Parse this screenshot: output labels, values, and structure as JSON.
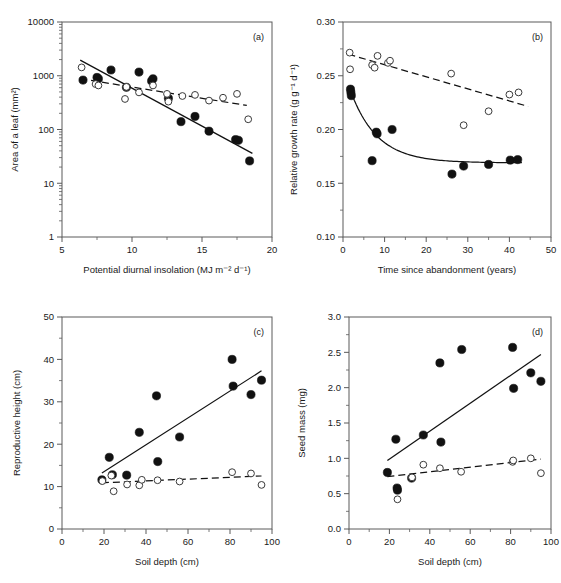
{
  "figure": {
    "title": "",
    "panels": [
      "a",
      "b",
      "c",
      "d"
    ]
  },
  "chart_data": [
    {
      "id": "a",
      "panel_label": "(a)",
      "type": "scatter",
      "title": "",
      "xlabel": "Potential diurnal insolation (MJ m⁻² d⁻¹)",
      "ylabel": "Area of a leaf (mm²)",
      "xscale": "linear",
      "yscale": "log",
      "xlim": [
        5,
        20
      ],
      "ylim": [
        1,
        10000
      ],
      "xticks": [
        5,
        10,
        15,
        20
      ],
      "xticklabels": [
        "5",
        "10",
        "15",
        "20"
      ],
      "yticks": [
        1,
        10,
        100,
        1000,
        10000
      ],
      "yticklabels": [
        "1",
        "10",
        "100",
        "1000",
        "10000"
      ],
      "grid": false,
      "legend": "none",
      "series": [
        {
          "name": "filled",
          "marker": "filled-circle",
          "points": [
            [
              6.5,
              830
            ],
            [
              7.5,
              930
            ],
            [
              7.6,
              880
            ],
            [
              8.5,
              1280
            ],
            [
              9.6,
              610
            ],
            [
              10.5,
              1170
            ],
            [
              11.4,
              800
            ],
            [
              11.5,
              880
            ],
            [
              12.6,
              380
            ],
            [
              13.5,
              140
            ],
            [
              14.5,
              175
            ],
            [
              15.5,
              93
            ],
            [
              17.4,
              65
            ],
            [
              17.6,
              63
            ],
            [
              18.4,
              26
            ]
          ],
          "fit": {
            "style": "solid",
            "x": [
              6.3,
              18.6
            ],
            "y": [
              1950,
              36
            ]
          }
        },
        {
          "name": "open",
          "marker": "open-circle",
          "points": [
            [
              6.4,
              1430
            ],
            [
              7.4,
              700
            ],
            [
              7.6,
              660
            ],
            [
              9.5,
              370
            ],
            [
              9.6,
              620
            ],
            [
              10.5,
              490
            ],
            [
              11.5,
              660
            ],
            [
              12.5,
              460
            ],
            [
              12.6,
              330
            ],
            [
              13.6,
              420
            ],
            [
              14.5,
              440
            ],
            [
              15.5,
              345
            ],
            [
              16.5,
              390
            ],
            [
              17.5,
              460
            ],
            [
              18.3,
              155
            ]
          ],
          "fit": {
            "style": "dashed",
            "x": [
              6.3,
              18.2
            ],
            "y": [
              880,
              280
            ]
          }
        }
      ]
    },
    {
      "id": "b",
      "panel_label": "(b)",
      "type": "scatter",
      "title": "",
      "xlabel": "Time since abandonment (years)",
      "ylabel": "Relative growth rate (g g⁻¹ d⁻¹)",
      "xscale": "linear",
      "yscale": "linear",
      "xlim": [
        0,
        50
      ],
      "ylim": [
        0.1,
        0.3
      ],
      "xticks": [
        0,
        10,
        20,
        30,
        40,
        50
      ],
      "xticklabels": [
        "0",
        "10",
        "20",
        "30",
        "40",
        "50"
      ],
      "yticks": [
        0.1,
        0.15,
        0.2,
        0.25,
        0.3
      ],
      "yticklabels": [
        "0.10",
        "0.15",
        "0.20",
        "0.25",
        "0.30"
      ],
      "grid": false,
      "legend": "none",
      "series": [
        {
          "name": "filled",
          "marker": "filled-circle",
          "points": [
            [
              1.8,
              0.2375
            ],
            [
              1.9,
              0.2345
            ],
            [
              2.0,
              0.2315
            ],
            [
              7.0,
              0.171
            ],
            [
              8.0,
              0.1975
            ],
            [
              8.2,
              0.196
            ],
            [
              11.8,
              0.2
            ],
            [
              26.2,
              0.1585
            ],
            [
              29.0,
              0.166
            ],
            [
              35.0,
              0.1675
            ],
            [
              40.2,
              0.1715
            ],
            [
              42.0,
              0.172
            ]
          ],
          "fit": {
            "style": "solid-curve",
            "model": "exponential-decay",
            "x_start": 1.8,
            "x_end": 43.0,
            "y_start": 0.236,
            "y_asymptote": 0.169,
            "rate": 0.155
          }
        },
        {
          "name": "open",
          "marker": "open-circle",
          "points": [
            [
              1.6,
              0.2715
            ],
            [
              1.7,
              0.256
            ],
            [
              7.0,
              0.26
            ],
            [
              7.6,
              0.2575
            ],
            [
              8.3,
              0.2685
            ],
            [
              10.8,
              0.262
            ],
            [
              11.3,
              0.264
            ],
            [
              26.0,
              0.252
            ],
            [
              29.0,
              0.204
            ],
            [
              35.0,
              0.217
            ],
            [
              40.0,
              0.2325
            ],
            [
              42.2,
              0.2345
            ]
          ],
          "fit": {
            "style": "dashed",
            "x": [
              1.3,
              44.5
            ],
            "y": [
              0.27,
              0.2215
            ]
          }
        }
      ]
    },
    {
      "id": "c",
      "panel_label": "(c)",
      "type": "scatter",
      "title": "",
      "xlabel": "Soil depth (cm)",
      "ylabel": "Reproductive height (cm)",
      "xscale": "linear",
      "yscale": "linear",
      "xlim": [
        0,
        100
      ],
      "ylim": [
        0,
        50
      ],
      "xticks": [
        0,
        20,
        40,
        60,
        80,
        100
      ],
      "xticklabels": [
        "0",
        "20",
        "40",
        "60",
        "80",
        "100"
      ],
      "yticks": [
        0,
        10,
        20,
        30,
        40,
        50
      ],
      "yticklabels": [
        "0",
        "10",
        "20",
        "30",
        "40",
        "50"
      ],
      "grid": false,
      "legend": "none",
      "series": [
        {
          "name": "filled",
          "marker": "filled-circle",
          "points": [
            [
              19.0,
              11.6
            ],
            [
              22.5,
              16.9
            ],
            [
              24.0,
              12.8
            ],
            [
              30.8,
              12.7
            ],
            [
              36.8,
              22.8
            ],
            [
              45.0,
              31.4
            ],
            [
              45.6,
              15.9
            ],
            [
              56.0,
              21.7
            ],
            [
              81.0,
              40.0
            ],
            [
              81.5,
              33.7
            ],
            [
              90.0,
              31.7
            ],
            [
              95.0,
              35.1
            ]
          ],
          "fit": {
            "style": "solid",
            "x": [
              19.0,
              95.0
            ],
            "y": [
              13.2,
              37.3
            ]
          }
        },
        {
          "name": "open",
          "marker": "open-circle",
          "points": [
            [
              19.2,
              11.3
            ],
            [
              23.5,
              12.6
            ],
            [
              24.6,
              8.9
            ],
            [
              31.0,
              10.5
            ],
            [
              36.8,
              10.3
            ],
            [
              38.0,
              11.6
            ],
            [
              45.5,
              11.5
            ],
            [
              56.0,
              11.2
            ],
            [
              81.0,
              13.4
            ],
            [
              90.0,
              13.1
            ],
            [
              95.0,
              10.4
            ]
          ],
          "fit": {
            "style": "dashed",
            "x": [
              19.0,
              95.0
            ],
            "y": [
              10.9,
              12.5
            ]
          }
        }
      ]
    },
    {
      "id": "d",
      "panel_label": "(d)",
      "type": "scatter",
      "title": "",
      "xlabel": "Soil depth (cm)",
      "ylabel": "Seed mass (mg)",
      "xscale": "linear",
      "yscale": "linear",
      "xlim": [
        0,
        100
      ],
      "ylim": [
        0.0,
        3.0
      ],
      "xticks": [
        0,
        20,
        40,
        60,
        80,
        100
      ],
      "xticklabels": [
        "0",
        "20",
        "40",
        "60",
        "80",
        "100"
      ],
      "yticks": [
        0.0,
        0.5,
        1.0,
        1.5,
        2.0,
        2.5,
        3.0
      ],
      "yticklabels": [
        "0.0",
        "0.5",
        "1.0",
        "1.5",
        "2.0",
        "2.5",
        "3.0"
      ],
      "grid": false,
      "legend": "none",
      "series": [
        {
          "name": "filled",
          "marker": "filled-circle",
          "points": [
            [
              19.0,
              0.8
            ],
            [
              23.2,
              1.27
            ],
            [
              23.8,
              0.58
            ],
            [
              24.0,
              0.55
            ],
            [
              31.0,
              0.72
            ],
            [
              36.8,
              1.33
            ],
            [
              45.0,
              2.35
            ],
            [
              45.5,
              1.23
            ],
            [
              55.8,
              2.54
            ],
            [
              81.0,
              2.57
            ],
            [
              81.5,
              1.99
            ],
            [
              90.0,
              2.21
            ],
            [
              95.0,
              2.09
            ]
          ],
          "fit": {
            "style": "solid",
            "x": [
              19.0,
              95.0
            ],
            "y": [
              0.97,
              2.47
            ]
          }
        },
        {
          "name": "open",
          "marker": "open-circle",
          "points": [
            [
              24.0,
              0.42
            ],
            [
              31.2,
              0.73
            ],
            [
              36.8,
              0.91
            ],
            [
              45.0,
              0.86
            ],
            [
              55.5,
              0.81
            ],
            [
              81.0,
              0.95
            ],
            [
              81.3,
              0.97
            ],
            [
              90.0,
              1.0
            ],
            [
              95.0,
              0.79
            ]
          ],
          "fit": {
            "style": "dashed",
            "x": [
              19.0,
              95.0
            ],
            "y": [
              0.74,
              0.99
            ]
          }
        }
      ]
    }
  ]
}
